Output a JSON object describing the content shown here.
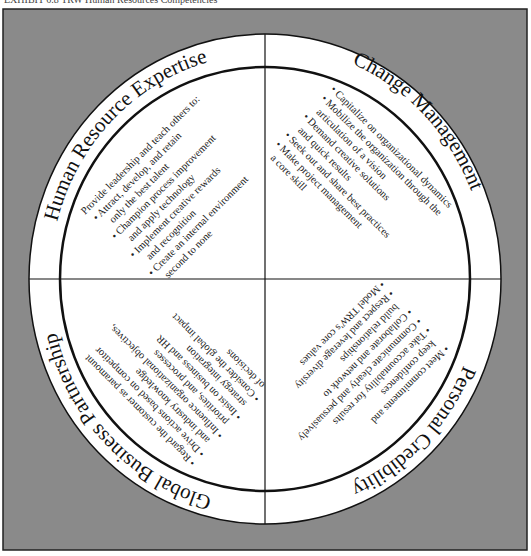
{
  "caption": "EXHIBIT 6.8    TRW Human Resources Competencies",
  "colors": {
    "background": "#8a8a8a",
    "frame": "#222222",
    "circle_fill": "#ffffff",
    "lines": "#111111"
  },
  "quadrants": {
    "top_left": {
      "title": "Human Resource Expertise",
      "items": [
        "Provide leadership and teach others to:",
        "• Attract, develop, and retain",
        "only the best talent",
        "• Champion process improvement",
        "and apply technology",
        "• Implement creative rewards",
        "and recognition",
        "• Create an internal environment",
        "second to none"
      ]
    },
    "top_right": {
      "title": "Change Management",
      "items": [
        "• Capitalize on organizational dynamics",
        "• Mobilize the organization through the",
        "articulation of a vision",
        "• Demand creative solutions",
        "and quick results",
        "• Seek out and share best practices",
        "• Make project management",
        "a core skill"
      ]
    },
    "bottom_right": {
      "title": "Personal Credibility",
      "items": [
        "• Meet commitments and",
        "keep confidences",
        "• Take accountability for results",
        "• Communicate clearly and persuasively",
        "• Collaborate and network to",
        "build relationships",
        "• Respect and leverage diversity",
        "• Model TRW's core values"
      ]
    },
    "bottom_left": {
      "title": "Global Business Partnership",
      "items": [
        "• Regard the customer as paramount",
        "• Drive actions based on competitor",
        "and industry knowledge",
        "• Influence organizational objectives,",
        "priorities, and processes",
        "• Insist on business and HR",
        "strategy integration",
        "• Consider the global impact",
        "of decisions"
      ]
    }
  }
}
